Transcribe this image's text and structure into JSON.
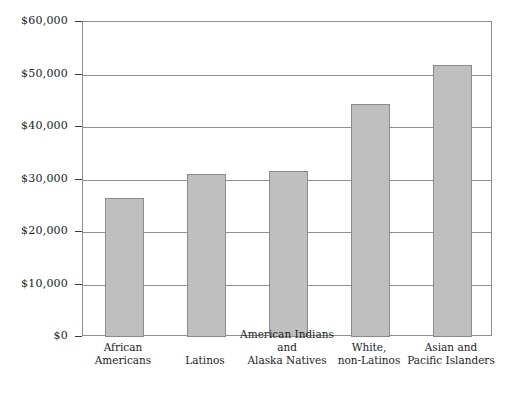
{
  "chart_data": {
    "type": "bar",
    "title": "",
    "subtitle": "",
    "xlabel": "",
    "ylabel": "",
    "categories": [
      "African Americans",
      "Latinos",
      "American Indians and Alaska Natives",
      "White, non-Latinos",
      "Asian and Pacific Islanders"
    ],
    "category_lines": [
      [
        "African",
        "Americans"
      ],
      [
        "Latinos"
      ],
      [
        "American Indians",
        "and",
        "Alaska Natives"
      ],
      [
        "White,",
        "non-Latinos"
      ],
      [
        "Asian and",
        "Pacific Islanders"
      ]
    ],
    "values": [
      26500,
      31000,
      31700,
      44400,
      51900
    ],
    "ylim": [
      0,
      60000
    ],
    "ytick_values": [
      0,
      10000,
      20000,
      30000,
      40000,
      50000,
      60000
    ],
    "ytick_labels": [
      "$0",
      "$10,000",
      "$20,000",
      "$30,000",
      "$40,000",
      "$50,000",
      "$60,000"
    ],
    "grid": true,
    "legend": false,
    "legend_position": "none",
    "colors": {
      "bar_fill": "#bfbfbf",
      "bar_border": "#8a8a8a",
      "gridline": "#8e8e8e",
      "frame": "#8e8e8e",
      "text": "#1c1c1c"
    }
  }
}
